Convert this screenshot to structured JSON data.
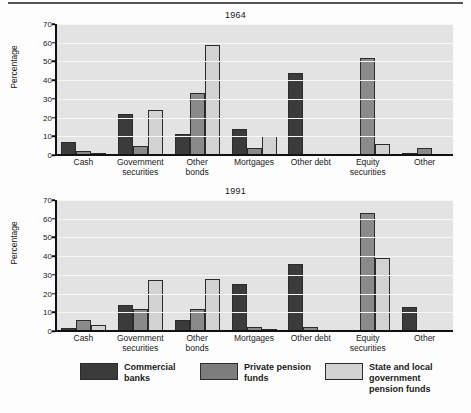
{
  "colors": {
    "series_commercial_banks": "#3b3b3b",
    "series_private_pension": "#8a8a8a",
    "series_state_local_pension": "#d2d2d2",
    "plot_background": "#e3e3e3",
    "gridline": "#f7f7f7",
    "axis": "#111111"
  },
  "legend": {
    "items": [
      {
        "name": "commercial-banks",
        "label": "Commercial\nbanks",
        "color": "#3b3b3b"
      },
      {
        "name": "private-pension-funds",
        "label": "Private pension\nfunds",
        "color": "#7d7d7d"
      },
      {
        "name": "state-local-pension-funds",
        "label": "State and local government\npension funds",
        "color": "#d2d2d2"
      }
    ]
  },
  "chart_data": [
    {
      "type": "bar",
      "title": "1964",
      "xlabel": "",
      "ylabel": "Percentage",
      "ylim": [
        0,
        70
      ],
      "yticks": [
        0,
        10,
        20,
        30,
        40,
        50,
        60,
        70
      ],
      "grid": true,
      "legend_position": "bottom",
      "categories": [
        "Cash",
        "Government securities",
        "Other bonds",
        "Mortgages",
        "Other debt",
        "Equity securities",
        "Other"
      ],
      "category_lines": [
        [
          "Cash"
        ],
        [
          "Government",
          "securities"
        ],
        [
          "Other",
          "bonds"
        ],
        [
          "Mortgages"
        ],
        [
          "Other debt"
        ],
        [
          "Equity",
          "securities"
        ],
        [
          "Other"
        ]
      ],
      "series": [
        {
          "name": "Commercial banks",
          "values": [
            7,
            22,
            11,
            14,
            44,
            0,
            1
          ]
        },
        {
          "name": "Private pension funds",
          "values": [
            2,
            5,
            33,
            4,
            0,
            52,
            4
          ]
        },
        {
          "name": "State and local government pension funds",
          "values": [
            1,
            24,
            59,
            10,
            0,
            6,
            0
          ]
        }
      ]
    },
    {
      "type": "bar",
      "title": "1991",
      "xlabel": "",
      "ylabel": "Percentage",
      "ylim": [
        0,
        70
      ],
      "yticks": [
        0,
        10,
        20,
        30,
        40,
        50,
        60,
        70
      ],
      "grid": true,
      "legend_position": "bottom",
      "categories": [
        "Cash",
        "Government securities",
        "Other bonds",
        "Mortgages",
        "Other debt",
        "Equity securities",
        "Other"
      ],
      "category_lines": [
        [
          "Cash"
        ],
        [
          "Government",
          "securities"
        ],
        [
          "Other",
          "bonds"
        ],
        [
          "Mortgages"
        ],
        [
          "Other debt"
        ],
        [
          "Equity",
          "securities"
        ],
        [
          "Other"
        ]
      ],
      "series": [
        {
          "name": "Commercial banks",
          "values": [
            1.5,
            14,
            6,
            25,
            36,
            0,
            13
          ]
        },
        {
          "name": "Private pension funds",
          "values": [
            6,
            12,
            12,
            2,
            2,
            63,
            0
          ]
        },
        {
          "name": "State and local government pension funds",
          "values": [
            3,
            27,
            28,
            0.5,
            0,
            39,
            0
          ]
        }
      ]
    }
  ]
}
